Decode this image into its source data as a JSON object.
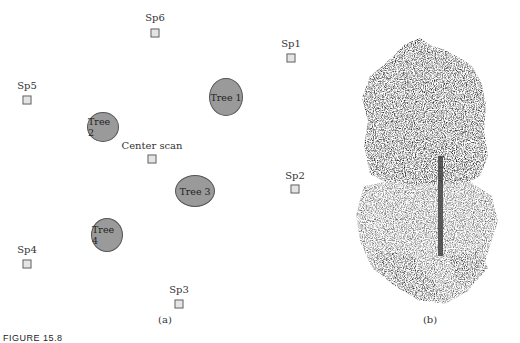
{
  "panel_a": {
    "label": "(a)",
    "scan_positions": [
      {
        "id": "sp6",
        "label": "Sp6",
        "x": 155,
        "y": 33
      },
      {
        "id": "sp1",
        "label": "Sp1",
        "x": 291,
        "y": 58
      },
      {
        "id": "sp5",
        "label": "Sp5",
        "x": 27,
        "y": 100
      },
      {
        "id": "center",
        "label": "Center scan",
        "x": 152,
        "y": 159
      },
      {
        "id": "sp2",
        "label": "Sp2",
        "x": 295,
        "y": 189
      },
      {
        "id": "sp4",
        "label": "Sp4",
        "x": 27,
        "y": 264
      },
      {
        "id": "sp3",
        "label": "Sp3",
        "x": 179,
        "y": 304
      }
    ],
    "trees": [
      {
        "id": "tree1",
        "label": "Tree 1",
        "x": 226,
        "y": 97,
        "w": 32,
        "h": 36
      },
      {
        "id": "tree2",
        "label": "Tree 2",
        "x": 103,
        "y": 127,
        "w": 30,
        "h": 28
      },
      {
        "id": "tree3",
        "label": "Tree 3",
        "x": 195,
        "y": 191,
        "w": 38,
        "h": 30
      },
      {
        "id": "tree4",
        "label": "Tree 4",
        "x": 107,
        "y": 235,
        "w": 30,
        "h": 32
      }
    ]
  },
  "panel_b": {
    "label": "(b)",
    "description": "Terrestrial laser scan point cloud of a tree"
  },
  "caption": "FIGURE 15.8"
}
